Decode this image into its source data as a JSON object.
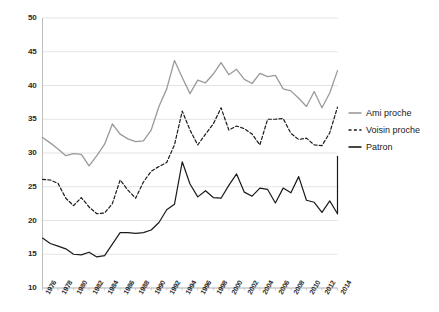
{
  "chart_data": {
    "type": "line",
    "title": "",
    "subtitle": "",
    "xlabel": "",
    "ylabel": "",
    "xlim": [
      1975,
      2015
    ],
    "ylim": [
      10,
      50
    ],
    "grid": true,
    "legend_position": "right",
    "y_ticks": [
      10,
      15,
      20,
      25,
      30,
      35,
      40,
      45,
      50
    ],
    "x_tick_labels": [
      "1976",
      "1978",
      "1980",
      "1982",
      "1984",
      "1986",
      "1988",
      "1990",
      "1992",
      "1994",
      "1996",
      "1998",
      "2000",
      "2002",
      "2004",
      "2006",
      "2008",
      "2010",
      "2012",
      "2014"
    ],
    "x": [
      1976,
      1977,
      1978,
      1979,
      1980,
      1981,
      1982,
      1983,
      1984,
      1985,
      1986,
      1987,
      1988,
      1989,
      1990,
      1991,
      1992,
      1993,
      1994,
      1995,
      1996,
      1997,
      1998,
      1999,
      2000,
      2001,
      2002,
      2003,
      2004,
      2005,
      2006,
      2007,
      2008,
      2009,
      2010,
      2011,
      2012,
      2013,
      2014
    ],
    "series": [
      {
        "name": "Ami proche",
        "style": "solid",
        "color": "#9a9a9a",
        "values": [
          32.3,
          31.5,
          30.6,
          29.6,
          29.9,
          29.8,
          28.1,
          29.6,
          31.3,
          34.3,
          32.8,
          32.1,
          31.7,
          31.8,
          33.4,
          36.9,
          39.5,
          43.7,
          41.2,
          38.8,
          40.8,
          40.4,
          41.7,
          43.4,
          41.6,
          42.4,
          40.9,
          40.3,
          41.8,
          41.3,
          41.5,
          39.5,
          39.2,
          38.1,
          36.9,
          39.1,
          36.7,
          38.9,
          42.2
        ]
      },
      {
        "name": "Voisin proche",
        "style": "dashed",
        "color": "#1a1a1a",
        "values": [
          26.1,
          26.0,
          25.5,
          23.3,
          22.2,
          23.4,
          22.0,
          21.0,
          21.1,
          22.5,
          26.0,
          24.5,
          23.3,
          25.7,
          27.3,
          28.0,
          28.6,
          31.2,
          36.2,
          33.4,
          31.2,
          32.8,
          34.3,
          36.7,
          33.4,
          34.0,
          33.6,
          32.8,
          31.2,
          35.0,
          35.0,
          35.1,
          32.9,
          32.0,
          32.2,
          31.2,
          31.1,
          33.0,
          36.8
        ]
      },
      {
        "name": "Patron",
        "style": "solid",
        "color": "#1a1a1a",
        "values": [
          17.4,
          16.6,
          16.2,
          15.8,
          15.0,
          14.9,
          15.3,
          14.6,
          14.8,
          16.5,
          18.2,
          18.2,
          18.1,
          18.2,
          18.6,
          19.7,
          21.6,
          22.4,
          28.7,
          25.4,
          23.5,
          24.4,
          23.4,
          23.3,
          25.2,
          26.9,
          24.2,
          23.6,
          24.8,
          24.6,
          22.6,
          24.8,
          24.1,
          26.5,
          23.0,
          22.7,
          21.2,
          22.9,
          21.0
        ]
      }
    ],
    "patron_tail": {
      "note": "final rise",
      "last_value": 29.5
    }
  },
  "legend": {
    "items": [
      {
        "label": "Ami proche",
        "style": "solid",
        "color": "#9a9a9a"
      },
      {
        "label": "Voisin proche",
        "style": "dashed",
        "color": "#1a1a1a"
      },
      {
        "label": "Patron",
        "style": "solid",
        "color": "#1a1a1a"
      }
    ]
  },
  "axes": {
    "grid_color": "#e3e3e3",
    "axis_color": "#bdbdbd",
    "tick_text_color": "#2b2b2b"
  }
}
